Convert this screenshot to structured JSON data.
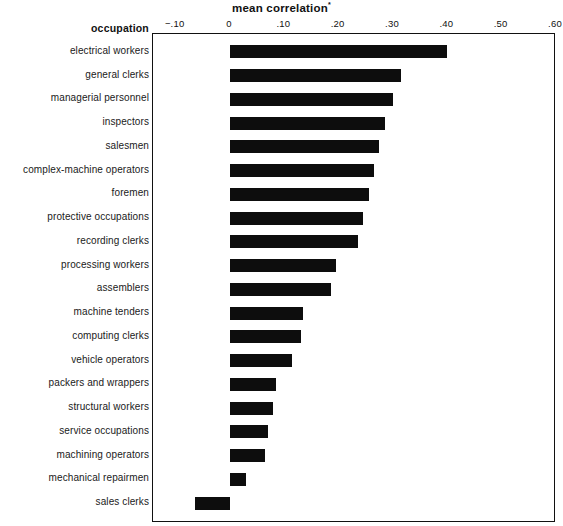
{
  "chart_data": {
    "type": "bar",
    "orientation": "horizontal",
    "title": "mean correlation",
    "title_superscript": "*",
    "xlabel": "",
    "ylabel": "occupation",
    "xlim": [
      -0.145,
      0.6
    ],
    "grid": false,
    "legend": null,
    "bar_color": "#0d0d0d",
    "axis_position": "top",
    "tick_labels": [
      "−.10",
      "0",
      ".10",
      ".20",
      ".30",
      ".40",
      ".50",
      ".60"
    ],
    "tick_values": [
      -0.1,
      0,
      0.1,
      0.2,
      0.3,
      0.4,
      0.5,
      0.6
    ],
    "categories": [
      "electrical workers",
      "general clerks",
      "managerial personnel",
      "inspectors",
      "salesmen",
      "complex-machine operators",
      "foremen",
      "protective occupations",
      "recording clerks",
      "processing workers",
      "assemblers",
      "machine tenders",
      "computing clerks",
      "vehicle  operators",
      "packers and wrappers",
      "structural workers",
      "service occupations",
      "machining operators",
      "mechanical repairmen",
      "sales clerks"
    ],
    "values": [
      0.4,
      0.315,
      0.3,
      0.285,
      0.275,
      0.265,
      0.255,
      0.245,
      0.235,
      0.195,
      0.185,
      0.135,
      0.13,
      0.115,
      0.085,
      0.08,
      0.07,
      0.065,
      0.03,
      -0.065
    ]
  },
  "header": {
    "occupation_label": "occupation"
  }
}
